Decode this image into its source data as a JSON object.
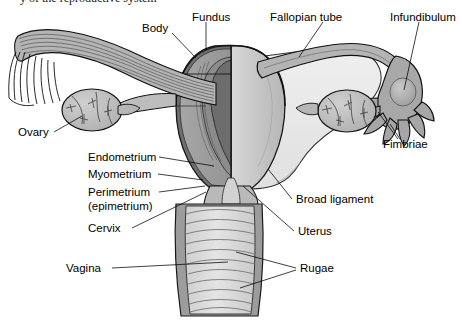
{
  "figure": {
    "cropped_top_text": "y of the reproductive system",
    "background_color": "#ffffff"
  },
  "palette": {
    "outline": "#000000",
    "myometrium_cut": "#9a9a9a",
    "endometrium_cut": "#7d7d7d",
    "perimetrium_cut": "#6e6e6e",
    "uterus_surface": "#c6c6c6",
    "broad_ligament": "#e9e9e9",
    "ovary": "#bdbdbd",
    "tube_wall": "#b4b4b4",
    "vagina_rugae": "#dcdcdc",
    "cervix_canal": "#d2d2d2",
    "leader_line": "#000000"
  },
  "labels": [
    {
      "id": "body",
      "text": "Body",
      "x": 142,
      "y": 28,
      "anchor": "start"
    },
    {
      "id": "fundus",
      "text": "Fundus",
      "x": 192,
      "y": 17,
      "anchor": "start"
    },
    {
      "id": "fallopian",
      "text": "Fallopian tube",
      "x": 270,
      "y": 17,
      "anchor": "start"
    },
    {
      "id": "infundibulum",
      "text": "Infundibulum",
      "x": 393,
      "y": 17,
      "anchor": "start"
    },
    {
      "id": "ovary",
      "text": "Ovary",
      "x": 18,
      "y": 136,
      "anchor": "start"
    },
    {
      "id": "fimbriae",
      "text": "Fimbriae",
      "x": 383,
      "y": 144,
      "anchor": "start"
    },
    {
      "id": "endometrium",
      "text": "Endometrium",
      "x": 88,
      "y": 161,
      "anchor": "start"
    },
    {
      "id": "myometrium",
      "text": "Myometrium",
      "x": 88,
      "y": 178,
      "anchor": "start"
    },
    {
      "id": "perimetrium",
      "text": "Perimetrium",
      "x": 88,
      "y": 196,
      "anchor": "start"
    },
    {
      "id": "epimetrium",
      "text": "(epimetrium)",
      "x": 88,
      "y": 210,
      "anchor": "start"
    },
    {
      "id": "broad_ligament",
      "text": "Broad ligament",
      "x": 296,
      "y": 203,
      "anchor": "start"
    },
    {
      "id": "cervix",
      "text": "Cervix",
      "x": 88,
      "y": 232,
      "anchor": "start"
    },
    {
      "id": "uterus",
      "text": "Uterus",
      "x": 298,
      "y": 235,
      "anchor": "start"
    },
    {
      "id": "vagina",
      "text": "Vagina",
      "x": 66,
      "y": 272,
      "anchor": "start"
    },
    {
      "id": "rugae",
      "text": "Rugae",
      "x": 300,
      "y": 272,
      "anchor": "start"
    }
  ],
  "structures": [
    {
      "id": "uterus-body",
      "name": "Uterus"
    },
    {
      "id": "uterine-fundus",
      "name": "Fundus"
    },
    {
      "id": "endometrium-layer",
      "name": "Endometrium"
    },
    {
      "id": "myometrium-layer",
      "name": "Myometrium"
    },
    {
      "id": "perimetrium-layer",
      "name": "Perimetrium (epimetrium)"
    },
    {
      "id": "cervix",
      "name": "Cervix"
    },
    {
      "id": "vagina",
      "name": "Vagina"
    },
    {
      "id": "vaginal-rugae",
      "name": "Rugae"
    },
    {
      "id": "fallopian-tube-left",
      "name": "Fallopian tube (left, sectioned)"
    },
    {
      "id": "fallopian-tube-right",
      "name": "Fallopian tube (right)"
    },
    {
      "id": "infundibulum",
      "name": "Infundibulum"
    },
    {
      "id": "fimbriae",
      "name": "Fimbriae"
    },
    {
      "id": "ovary-left",
      "name": "Ovary (left)"
    },
    {
      "id": "ovary-right",
      "name": "Ovary (right)"
    },
    {
      "id": "broad-ligament",
      "name": "Broad ligament"
    }
  ]
}
